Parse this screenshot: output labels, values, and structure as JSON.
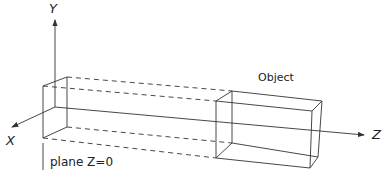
{
  "diagram": {
    "axes": {
      "y_label": "Y",
      "x_label": "X",
      "z_label": "Z"
    },
    "labels": {
      "object": "Object",
      "plane": "plane Z=0"
    },
    "colors": {
      "line": "#333333",
      "background": "#ffffff"
    }
  }
}
